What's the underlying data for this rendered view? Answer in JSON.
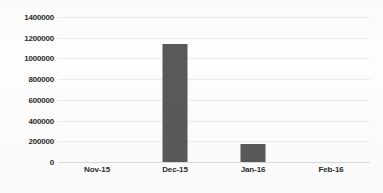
{
  "chart_data": {
    "type": "bar",
    "title": "",
    "subtitle": "",
    "xlabel": "",
    "ylabel": "",
    "categories": [
      "Nov-15",
      "Dec-15",
      "Jan-16",
      "Feb-16"
    ],
    "values": [
      0,
      1140000,
      178000,
      0
    ],
    "ylim": [
      0,
      1400000
    ],
    "ytick_step": 200000,
    "ytick_labels": [
      "0",
      "200000",
      "400000",
      "600000",
      "800000",
      "1000000",
      "1200000",
      "1400000"
    ],
    "ytick_values": [
      0,
      200000,
      400000,
      600000,
      800000,
      1000000,
      1200000,
      1400000
    ],
    "grid": true,
    "grid_axis": "y",
    "legend": false,
    "legend_position": "none",
    "bar_color": "#595959",
    "gridline_color": "#ececed",
    "axis_color": "#d9d9da",
    "text_color": "#2b2b2b",
    "background_color": "#fdfdfd"
  }
}
